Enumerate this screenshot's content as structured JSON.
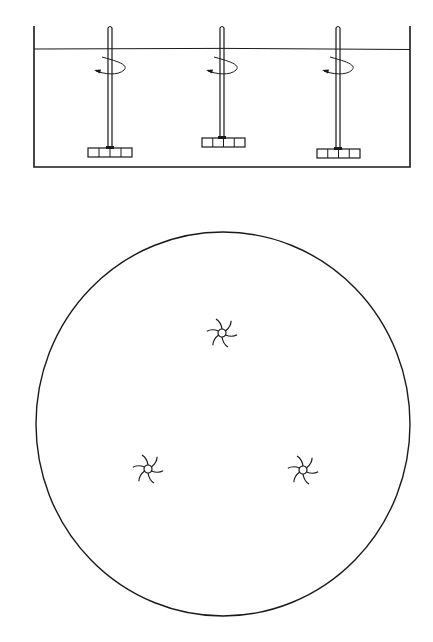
{
  "diagram": {
    "type": "multi-impeller mixing tank (side elevation and plan view)",
    "colors": {
      "ink": "#1a1a1a",
      "background": "#ffffff"
    },
    "side_view": {
      "tank": {
        "left": 34,
        "right": 410,
        "top": 26,
        "bottom": 167,
        "liquid_level": 49
      },
      "impellers": [
        {
          "id": "left",
          "shaft_x": 110,
          "shaft_top": 26,
          "blade_y": 148,
          "blade_left": 88,
          "blade_right": 132,
          "rotation_arrow": true
        },
        {
          "id": "center",
          "shaft_x": 222,
          "shaft_top": 26,
          "blade_y": 138,
          "blade_left": 202,
          "blade_right": 245,
          "rotation_arrow": true
        },
        {
          "id": "right",
          "shaft_x": 338,
          "shaft_top": 26,
          "blade_y": 149,
          "blade_left": 317,
          "blade_right": 360,
          "rotation_arrow": true
        }
      ]
    },
    "plan_view": {
      "vessel": {
        "cx": 223,
        "cy": 424,
        "rx": 187,
        "ry": 192
      },
      "impellers": [
        {
          "id": "top",
          "cx": 222,
          "cy": 333,
          "blades": 6
        },
        {
          "id": "bottom-left",
          "cx": 148,
          "cy": 469,
          "blades": 6
        },
        {
          "id": "bottom-right",
          "cx": 303,
          "cy": 470,
          "blades": 6
        }
      ]
    }
  }
}
